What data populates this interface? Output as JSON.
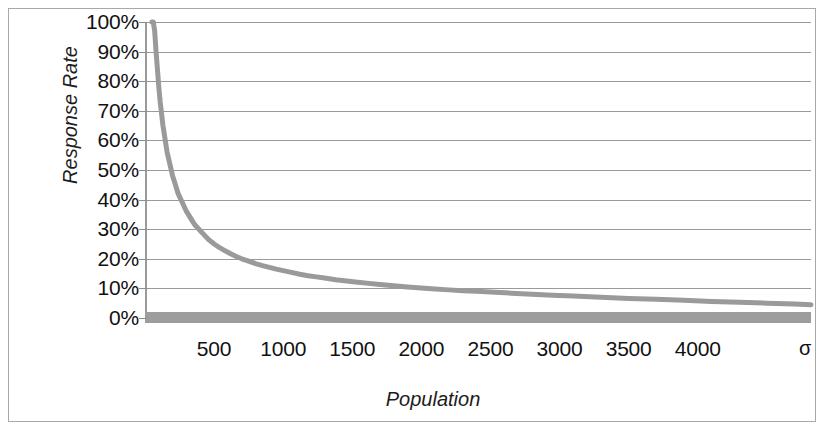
{
  "figure": {
    "width": 826,
    "height": 432,
    "background_color": "#ffffff",
    "frame_color": "#a8a8a8"
  },
  "axis_titles": {
    "y": "Response Rate",
    "x": "Population"
  },
  "chart_data": {
    "type": "line",
    "title": "",
    "subtitle": "",
    "xlabel": "Population",
    "ylabel": "Response Rate",
    "xlim": [
      0,
      4820
    ],
    "ylim": [
      0,
      1
    ],
    "grid": true,
    "grid_axis": "y",
    "legend": false,
    "legend_position": "none",
    "line_color": "#9a9a9a",
    "line_width": 5,
    "baseline_bar_color": "#9d9d9d",
    "gridline_color": "#9a9a9a",
    "x_tick_labels": [
      "500",
      "1000",
      "1500",
      "2000",
      "2500",
      "3000",
      "3500",
      "4000"
    ],
    "x_tick_values": [
      500,
      1000,
      1500,
      2000,
      2500,
      3000,
      3500,
      4000
    ],
    "x_axis_end_symbol": "σ",
    "y_tick_labels": [
      "100%",
      "90%",
      "80%",
      "70%",
      "60%",
      "50%",
      "40%",
      "30%",
      "20%",
      "10%",
      "0%"
    ],
    "y_tick_values": [
      1.0,
      0.9,
      0.8,
      0.7,
      0.6,
      0.5,
      0.4,
      0.3,
      0.2,
      0.1,
      0.0
    ],
    "series": [
      {
        "name": "Response Rate",
        "x": [
          50,
          60,
          70,
          80,
          90,
          100,
          110,
          120,
          130,
          140,
          150,
          160,
          170,
          180,
          190,
          200,
          210,
          220,
          230,
          240,
          250,
          260,
          270,
          280,
          300,
          320,
          340,
          360,
          380,
          400,
          420,
          440,
          460,
          480,
          500,
          540,
          580,
          620,
          660,
          700,
          750,
          800,
          850,
          900,
          950,
          1000,
          1060,
          1120,
          1180,
          1240,
          1300,
          1380,
          1460,
          1540,
          1620,
          1700,
          1800,
          1900,
          2000,
          2100,
          2200,
          2300,
          2400,
          2500,
          2650,
          2800,
          2950,
          3100,
          3300,
          3500,
          3700,
          3900,
          4100,
          4300,
          4500,
          4700,
          4820
        ],
        "y": [
          1.0,
          1.0,
          0.97,
          0.9,
          0.84,
          0.78,
          0.73,
          0.69,
          0.65,
          0.62,
          0.59,
          0.56,
          0.54,
          0.52,
          0.5,
          0.48,
          0.465,
          0.45,
          0.435,
          0.42,
          0.41,
          0.4,
          0.39,
          0.38,
          0.36,
          0.345,
          0.33,
          0.315,
          0.305,
          0.295,
          0.285,
          0.275,
          0.265,
          0.258,
          0.25,
          0.238,
          0.227,
          0.217,
          0.208,
          0.2,
          0.192,
          0.184,
          0.177,
          0.171,
          0.165,
          0.16,
          0.154,
          0.148,
          0.143,
          0.139,
          0.135,
          0.129,
          0.125,
          0.121,
          0.117,
          0.113,
          0.109,
          0.105,
          0.101,
          0.098,
          0.095,
          0.092,
          0.09,
          0.088,
          0.084,
          0.08,
          0.077,
          0.074,
          0.07,
          0.066,
          0.063,
          0.06,
          0.056,
          0.053,
          0.05,
          0.047,
          0.045
        ],
        "color": "#9a9a9a",
        "style": "solid",
        "marker": "none",
        "note": "Hyperbolic decay with discrete quantization steps in the tail"
      }
    ]
  }
}
